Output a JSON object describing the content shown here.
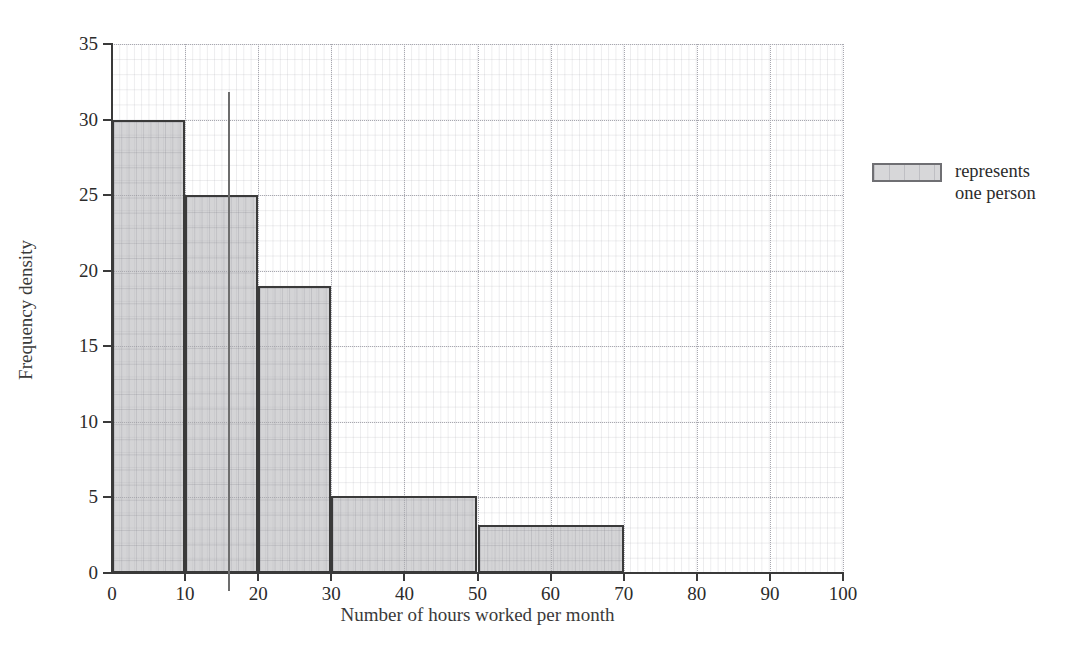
{
  "chart_data": {
    "type": "bar",
    "title": "",
    "subtitle": "",
    "xlabel": "Number of hours worked per month",
    "ylabel": "Frequency density",
    "xlim": [
      0,
      100
    ],
    "ylim": [
      0,
      35
    ],
    "xticks": [
      0,
      10,
      20,
      30,
      40,
      50,
      60,
      70,
      80,
      90,
      100
    ],
    "yticks": [
      0,
      5,
      10,
      15,
      20,
      25,
      30,
      35
    ],
    "xtick_labels": [
      "0",
      "10",
      "20",
      "30",
      "40",
      "50",
      "60",
      "70",
      "80",
      "90",
      "100"
    ],
    "ytick_labels": [
      "0",
      "5",
      "10",
      "15",
      "20",
      "25",
      "30",
      "35"
    ],
    "grid": true,
    "grid_minor": true,
    "legend_position": "right",
    "bins": [
      {
        "x0": 0,
        "x1": 10,
        "height": 30.0,
        "label": "0-10"
      },
      {
        "x0": 10,
        "x1": 20,
        "height": 25.0,
        "label": "10-20"
      },
      {
        "x0": 20,
        "x1": 30,
        "height": 19.0,
        "label": "20-30"
      },
      {
        "x0": 30,
        "x1": 50,
        "height": 5.1,
        "label": "30-50"
      },
      {
        "x0": 50,
        "x1": 70,
        "height": 3.2,
        "label": "50-70"
      }
    ],
    "categories": [
      "0-10",
      "10-20",
      "20-30",
      "30-50",
      "50-70"
    ],
    "values": [
      30.0,
      25.0,
      19.0,
      5.1,
      3.2
    ],
    "annotations": [
      {
        "name": "vertical-marker",
        "x": 16,
        "y_top": 31.8,
        "y_bottom": -1.2
      }
    ],
    "legend": {
      "swatch_name": "grey-square-swatch",
      "text": "represents\none person"
    },
    "colors": {
      "bar_fill": "#b0b0b4",
      "bar_edge": "#3a3a3a",
      "axis": "#3a3a3a",
      "grid_major": "#a8a8b0",
      "grid_minor": "#9696a0",
      "annotation": "#6d6d6d",
      "text": "#2b2b2b",
      "background": "#ffffff"
    }
  }
}
